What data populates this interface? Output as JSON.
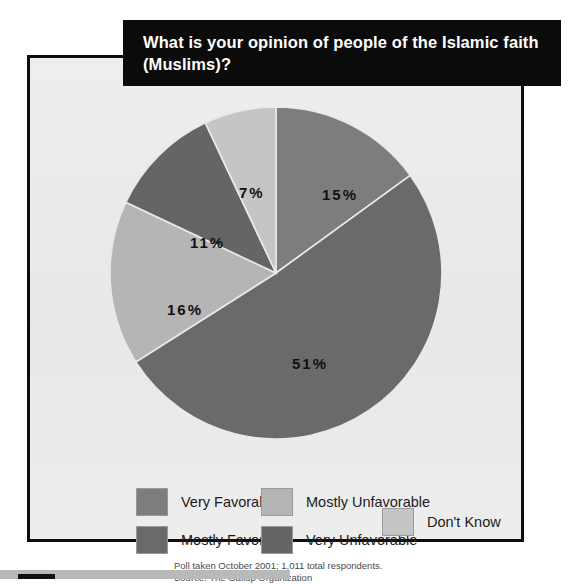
{
  "title": {
    "line1": "What is your opinion of people of the Islamic faith",
    "line2": "(Muslims)?"
  },
  "footnote": {
    "line1": "Poll taken October 2001; 1,011 total respondents.",
    "line2": "Source: The Gallup Organization"
  },
  "labels": {
    "l0": "15%",
    "l1": "51%",
    "l2": "16%",
    "l3": "11%",
    "l4": "7%"
  },
  "legend": {
    "items": [
      {
        "label": "Very Favorable",
        "color": "#7d7d7d"
      },
      {
        "label": "Mostly Favorable",
        "color": "#6a6a6a"
      },
      {
        "label": "Mostly Unfavorable",
        "color": "#b5b5b5"
      },
      {
        "label": "Very Unfavorable",
        "color": "#656565"
      },
      {
        "label": "Don't Know",
        "color": "#c5c5c5"
      }
    ]
  },
  "chart_data": {
    "type": "pie",
    "title": "What is your opinion of people of the Islamic faith (Muslims)?",
    "categories": [
      "Very Favorable",
      "Mostly Favorable",
      "Mostly Unfavorable",
      "Very Unfavorable",
      "Don't Know"
    ],
    "values": [
      15,
      51,
      16,
      11,
      7
    ],
    "value_labels": [
      "15%",
      "51%",
      "16%",
      "11%",
      "7%"
    ],
    "unit": "percent",
    "colors": [
      "#7d7d7d",
      "#6a6a6a",
      "#b5b5b5",
      "#656565",
      "#c5c5c5"
    ],
    "start_angle_deg": 0,
    "direction": "clockwise",
    "legend": "bottom",
    "grid": false,
    "source": "The Gallup Organization",
    "note": "Poll taken October 2001; 1,011 total respondents.",
    "total_respondents": 1011
  }
}
